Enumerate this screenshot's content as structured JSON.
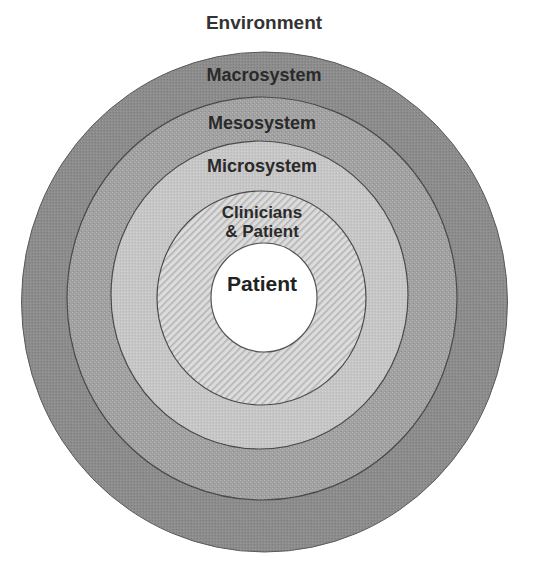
{
  "diagram": {
    "type": "concentric-circles",
    "title": "Environment",
    "layers": [
      {
        "id": "macrosystem",
        "label": "Macrosystem",
        "fill": "#8c8c8c",
        "pattern": "fine-dots"
      },
      {
        "id": "mesosystem",
        "label": "Mesosystem",
        "fill": "#a3a3a3",
        "pattern": "grid-dots"
      },
      {
        "id": "microsystem",
        "label": "Microsystem",
        "fill": "#c6c6c6",
        "pattern": "fine-dots"
      },
      {
        "id": "clinicians-patient",
        "label_line1": "Clinicians",
        "label_line2": "& Patient",
        "fill": "#d8d8d8",
        "pattern": "diagonal-hatch"
      },
      {
        "id": "patient",
        "label": "Patient",
        "fill": "#ffffff",
        "pattern": "none"
      }
    ],
    "outline_color": "#555555"
  }
}
